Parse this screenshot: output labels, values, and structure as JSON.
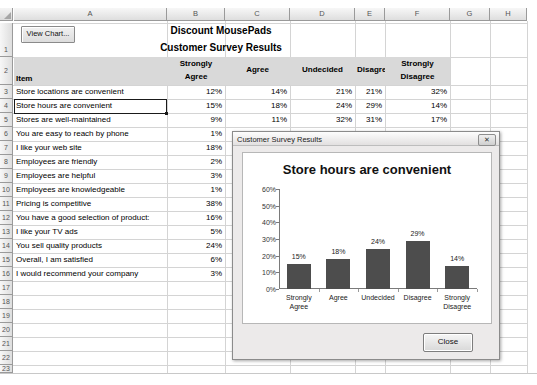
{
  "spreadsheet": {
    "columns": [
      "A",
      "B",
      "C",
      "D",
      "E",
      "F",
      "G",
      "H"
    ],
    "rows": [
      "1",
      "2",
      "3",
      "4",
      "5",
      "6",
      "7",
      "8",
      "9",
      "10",
      "11",
      "12",
      "13",
      "14",
      "15",
      "16",
      "17",
      "18",
      "19",
      "20",
      "21",
      "22",
      "23",
      "24",
      "25"
    ],
    "view_chart_button": "View Chart...",
    "title_line1": "Discount MousePads",
    "title_line2": "Customer Survey Results",
    "headers": {
      "item": "Item",
      "strongly_agree_l1": "Strongly",
      "strongly_agree_l2": "Agree",
      "agree": "Agree",
      "undecided": "Undecided",
      "disagree": "Disagree",
      "strongly_disagree_l1": "Strongly",
      "strongly_disagree_l2": "Disagree"
    },
    "selected_cell": "A4",
    "data_rows": [
      {
        "row": "3",
        "item": "Store locations are convenient",
        "strongly_agree": "12%",
        "agree": "14%",
        "undecided": "21%",
        "disagree": "21%",
        "strongly_disagree": "32%"
      },
      {
        "row": "4",
        "item": "Store hours are convenient",
        "strongly_agree": "15%",
        "agree": "18%",
        "undecided": "24%",
        "disagree": "29%",
        "strongly_disagree": "14%"
      },
      {
        "row": "5",
        "item": "Stores are well-maintained",
        "strongly_agree": "9%",
        "agree": "11%",
        "undecided": "32%",
        "disagree": "31%",
        "strongly_disagree": "17%"
      },
      {
        "row": "6",
        "item": "You are easy to reach by phone",
        "strongly_agree": "1%",
        "agree": "5%",
        "undecided": "9%",
        "disagree": "40%",
        "strongly_disagree": "45%"
      },
      {
        "row": "7",
        "item": "I like your web site",
        "strongly_agree": "18%",
        "agree": "",
        "undecided": "",
        "disagree": "",
        "strongly_disagree": ""
      },
      {
        "row": "8",
        "item": "Employees are friendly",
        "strongly_agree": "2%",
        "agree": "",
        "undecided": "",
        "disagree": "",
        "strongly_disagree": ""
      },
      {
        "row": "9",
        "item": "Employees are helpful",
        "strongly_agree": "3%",
        "agree": "",
        "undecided": "",
        "disagree": "",
        "strongly_disagree": ""
      },
      {
        "row": "10",
        "item": "Employees are knowledgeable",
        "strongly_agree": "1%",
        "agree": "",
        "undecided": "",
        "disagree": "",
        "strongly_disagree": ""
      },
      {
        "row": "11",
        "item": "Pricing is competitive",
        "strongly_agree": "38%",
        "agree": "",
        "undecided": "",
        "disagree": "",
        "strongly_disagree": ""
      },
      {
        "row": "12",
        "item": "You have a good selection of product:",
        "strongly_agree": "16%",
        "agree": "",
        "undecided": "",
        "disagree": "",
        "strongly_disagree": ""
      },
      {
        "row": "13",
        "item": "I like your TV ads",
        "strongly_agree": "5%",
        "agree": "",
        "undecided": "",
        "disagree": "",
        "strongly_disagree": ""
      },
      {
        "row": "14",
        "item": "You sell quality products",
        "strongly_agree": "24%",
        "agree": "",
        "undecided": "",
        "disagree": "",
        "strongly_disagree": ""
      },
      {
        "row": "15",
        "item": "Overall, I am satisfied",
        "strongly_agree": "6%",
        "agree": "",
        "undecided": "",
        "disagree": "",
        "strongly_disagree": ""
      },
      {
        "row": "16",
        "item": "I would recommend your company",
        "strongly_agree": "3%",
        "agree": "",
        "undecided": "",
        "disagree": "",
        "strongly_disagree": ""
      }
    ]
  },
  "dialog": {
    "title": "Customer Survey Results",
    "close_x": "✕",
    "close_button": "Close"
  },
  "chart_data": {
    "type": "bar",
    "title": "Store hours are convenient",
    "categories": [
      "Strongly Agree",
      "Agree",
      "Undecided",
      "Disagree",
      "Strongly Disagree"
    ],
    "category_lines": [
      [
        "Strongly",
        "Agree"
      ],
      [
        "Agree",
        ""
      ],
      [
        "Undecided",
        ""
      ],
      [
        "Disagree",
        ""
      ],
      [
        "Strongly",
        "Disagree"
      ]
    ],
    "values": [
      15,
      18,
      24,
      29,
      14
    ],
    "data_labels": [
      "15%",
      "18%",
      "24%",
      "29%",
      "14%"
    ],
    "ylim": [
      0,
      60
    ],
    "yticks": [
      0,
      10,
      20,
      30,
      40,
      50,
      60
    ],
    "ytick_labels": [
      "0%",
      "10%",
      "20%",
      "30%",
      "40%",
      "50%",
      "60%"
    ],
    "xlabel": "",
    "ylabel": "",
    "grid": false,
    "legend": false,
    "bar_color": "#4d4d4d"
  }
}
